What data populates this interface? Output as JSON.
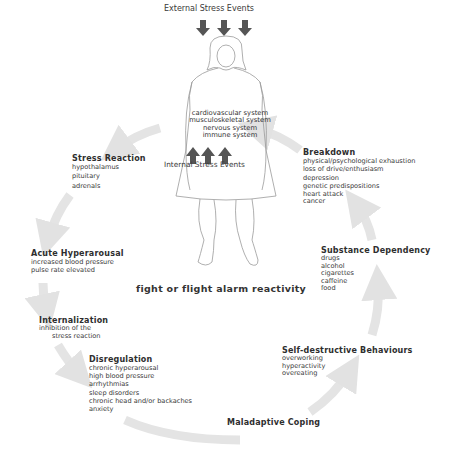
{
  "diagram": {
    "external_label": "External Stress Events",
    "internal_label": "Internal Stress Events",
    "body_systems": [
      "cardiovascular system",
      "musculoskeletal system",
      "nervous system",
      "immune system"
    ],
    "center_label": "fight or flight alarm reactivity",
    "arrow_color": "#e4e4e4",
    "stress_arrow_color": "#555555",
    "stages": [
      {
        "title": "Stress Reaction",
        "items": [
          "hypothalamus",
          "pituitary",
          "adrenals"
        ]
      },
      {
        "title": "Acute Hyperarousal",
        "items": [
          "increased blood pressure",
          "pulse rate elevated"
        ]
      },
      {
        "title": "Internalization",
        "items": [
          "inhibition of the",
          "stress reaction"
        ]
      },
      {
        "title": "Disregulation",
        "items": [
          "chronic hyperarousal",
          "high blood pressure",
          "arrhythmias",
          "sleep disorders",
          "chronic head and/or backaches",
          "anxiety"
        ]
      },
      {
        "title": "Maladaptive Coping",
        "items": []
      },
      {
        "title": "Self-destructive Behaviours",
        "items": [
          "overworking",
          "hyperactivity",
          "overeating"
        ]
      },
      {
        "title": "Substance Dependency",
        "items": [
          "drugs",
          "alcohol",
          "cigarettes",
          "caffeine",
          "food"
        ]
      },
      {
        "title": "Breakdown",
        "items": [
          "physical/psychological exhaustion",
          "loss of drive/enthusiasm",
          "depression",
          "genetic predispositions",
          "heart attack",
          "cancer"
        ]
      }
    ]
  }
}
